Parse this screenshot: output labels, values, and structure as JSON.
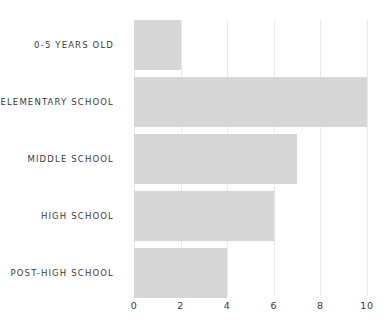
{
  "chart_data": {
    "type": "bar",
    "orientation": "horizontal",
    "title": "",
    "xlabel": "",
    "ylabel": "",
    "categories": [
      "0-5 years old",
      "Elementary school",
      "Middle school",
      "High school",
      "Post-high school"
    ],
    "category_labels_display": [
      "0-5 YEARS OLD",
      "ELEMENTARY SCHOOL",
      "MIDDLE SCHOOL",
      "HIGH SCHOOL",
      "POST-HIGH SCHOOL"
    ],
    "values": [
      2,
      10,
      7,
      6,
      4
    ],
    "xlim": [
      0,
      10
    ],
    "xticks": [
      0,
      2,
      4,
      6,
      8,
      10
    ],
    "xtick_labels": [
      "0",
      "2",
      "4",
      "6",
      "8",
      "10"
    ],
    "grid": "vertical",
    "legend": "none",
    "bar_color": "#d6d6d6",
    "gridline_color": "#e9e9e9",
    "text_color": "#3a3a3a",
    "background_color": "#ffffff"
  }
}
